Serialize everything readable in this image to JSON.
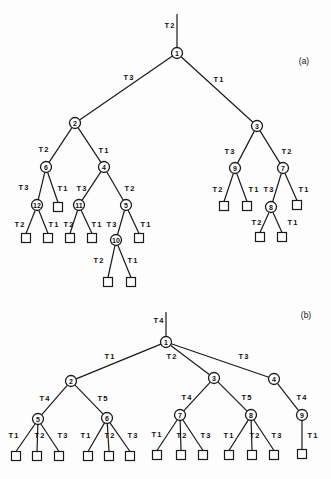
{
  "diagrams": [
    {
      "id": "a",
      "panel_label": "(a)",
      "panel_label_pos": [
        304,
        61
      ],
      "root_line": {
        "from": [
          177,
          14
        ],
        "to": [
          177,
          48
        ],
        "label": "T2",
        "label_pos": [
          170,
          25
        ]
      },
      "nodes": [
        {
          "id": "1",
          "x": 177,
          "y": 53
        },
        {
          "id": "2",
          "x": 75,
          "y": 123
        },
        {
          "id": "3",
          "x": 257,
          "y": 126
        },
        {
          "id": "6",
          "x": 46,
          "y": 167
        },
        {
          "id": "4",
          "x": 104,
          "y": 167
        },
        {
          "id": "12",
          "x": 37,
          "y": 205
        },
        {
          "id": "11",
          "x": 79,
          "y": 205
        },
        {
          "id": "5",
          "x": 126,
          "y": 205
        },
        {
          "id": "10",
          "x": 116,
          "y": 240
        },
        {
          "id": "9",
          "x": 235,
          "y": 168
        },
        {
          "id": "7",
          "x": 283,
          "y": 168
        },
        {
          "id": "8",
          "x": 271,
          "y": 207
        }
      ],
      "leaves": [
        {
          "id": "a-l1",
          "x": 58,
          "y": 207
        },
        {
          "id": "a-l2",
          "x": 26,
          "y": 238
        },
        {
          "id": "a-l3",
          "x": 48,
          "y": 238
        },
        {
          "id": "a-l4",
          "x": 70,
          "y": 238
        },
        {
          "id": "a-l5",
          "x": 92,
          "y": 238
        },
        {
          "id": "a-l6",
          "x": 139,
          "y": 238
        },
        {
          "id": "a-l7",
          "x": 108,
          "y": 282
        },
        {
          "id": "a-l8",
          "x": 131,
          "y": 282
        },
        {
          "id": "a-l9",
          "x": 224,
          "y": 206
        },
        {
          "id": "a-l10",
          "x": 247,
          "y": 206
        },
        {
          "id": "a-l11",
          "x": 297,
          "y": 205
        },
        {
          "id": "a-l12",
          "x": 260,
          "y": 237
        },
        {
          "id": "a-l13",
          "x": 282,
          "y": 237
        }
      ],
      "edges": [
        {
          "from": "1",
          "to": "2",
          "label": "T3",
          "label_pos": [
            129,
            77
          ]
        },
        {
          "from": "1",
          "to": "3",
          "label": "T1",
          "label_pos": [
            219,
            79
          ]
        },
        {
          "from": "2",
          "to": "6",
          "label": "T2",
          "label_pos": [
            44,
            149
          ]
        },
        {
          "from": "2",
          "to": "4",
          "label": "T1",
          "label_pos": [
            104,
            150
          ]
        },
        {
          "from": "6",
          "to": "12",
          "label": "T3",
          "label_pos": [
            24,
            187
          ]
        },
        {
          "from": "6",
          "to": "a-l1",
          "label": "T1",
          "label_pos": [
            63,
            188
          ]
        },
        {
          "from": "4",
          "to": "11",
          "label": "T3",
          "label_pos": [
            82,
            188
          ]
        },
        {
          "from": "4",
          "to": "5",
          "label": "T2",
          "label_pos": [
            130,
            188
          ]
        },
        {
          "from": "12",
          "to": "a-l2",
          "label": "T2",
          "label_pos": [
            20,
            224
          ]
        },
        {
          "from": "12",
          "to": "a-l3",
          "label": "T1",
          "label_pos": [
            54,
            224
          ]
        },
        {
          "from": "11",
          "to": "a-l4",
          "label": "T2",
          "label_pos": [
            69,
            224
          ]
        },
        {
          "from": "11",
          "to": "a-l5",
          "label": "T1",
          "label_pos": [
            97,
            224
          ]
        },
        {
          "from": "5",
          "to": "10",
          "label": "T3",
          "label_pos": [
            112,
            224
          ]
        },
        {
          "from": "5",
          "to": "a-l6",
          "label": "T1",
          "label_pos": [
            146,
            224
          ]
        },
        {
          "from": "10",
          "to": "a-l7",
          "label": "T2",
          "label_pos": [
            99,
            260
          ]
        },
        {
          "from": "10",
          "to": "a-l8",
          "label": "T1",
          "label_pos": [
            133,
            260
          ]
        },
        {
          "from": "3",
          "to": "9",
          "label": "T3",
          "label_pos": [
            230,
            151
          ]
        },
        {
          "from": "3",
          "to": "7",
          "label": "T2",
          "label_pos": [
            287,
            151
          ]
        },
        {
          "from": "9",
          "to": "a-l9",
          "label": "T2",
          "label_pos": [
            218,
            189
          ]
        },
        {
          "from": "9",
          "to": "a-l10",
          "label": "T1",
          "label_pos": [
            254,
            189
          ]
        },
        {
          "from": "7",
          "to": "8",
          "label": "T3",
          "label_pos": [
            269,
            189
          ]
        },
        {
          "from": "7",
          "to": "a-l11",
          "label": "T1",
          "label_pos": [
            304,
            189
          ]
        },
        {
          "from": "8",
          "to": "a-l12",
          "label": "T2",
          "label_pos": [
            257,
            222
          ]
        },
        {
          "from": "8",
          "to": "a-l13",
          "label": "T1",
          "label_pos": [
            293,
            222
          ]
        }
      ]
    },
    {
      "id": "b",
      "panel_label": "(b)",
      "panel_label_pos": [
        306,
        315
      ],
      "root_line": {
        "from": [
          166,
          312
        ],
        "to": [
          166,
          337
        ],
        "label": "T4",
        "label_pos": [
          159,
          320
        ]
      },
      "nodes": [
        {
          "id": "1",
          "x": 166,
          "y": 342
        },
        {
          "id": "2",
          "x": 71,
          "y": 381
        },
        {
          "id": "3",
          "x": 214,
          "y": 378
        },
        {
          "id": "4",
          "x": 274,
          "y": 379
        },
        {
          "id": "5",
          "x": 38,
          "y": 419
        },
        {
          "id": "6",
          "x": 107,
          "y": 418
        },
        {
          "id": "7",
          "x": 180,
          "y": 415
        },
        {
          "id": "8",
          "x": 251,
          "y": 415
        },
        {
          "id": "9",
          "x": 302,
          "y": 415
        }
      ],
      "leaves": [
        {
          "id": "b-l1",
          "x": 16,
          "y": 456
        },
        {
          "id": "b-l2",
          "x": 37,
          "y": 456
        },
        {
          "id": "b-l3",
          "x": 59,
          "y": 456
        },
        {
          "id": "b-l4",
          "x": 88,
          "y": 456
        },
        {
          "id": "b-l5",
          "x": 109,
          "y": 456
        },
        {
          "id": "b-l6",
          "x": 130,
          "y": 456
        },
        {
          "id": "b-l7",
          "x": 157,
          "y": 455
        },
        {
          "id": "b-l8",
          "x": 181,
          "y": 455
        },
        {
          "id": "b-l9",
          "x": 203,
          "y": 455
        },
        {
          "id": "b-l10",
          "x": 229,
          "y": 455
        },
        {
          "id": "b-l11",
          "x": 252,
          "y": 455
        },
        {
          "id": "b-l12",
          "x": 274,
          "y": 455
        },
        {
          "id": "b-l13",
          "x": 302,
          "y": 454
        }
      ],
      "edges": [
        {
          "from": "1",
          "to": "2",
          "label": "T1",
          "label_pos": [
            110,
            356
          ]
        },
        {
          "from": "1",
          "to": "3",
          "label": "T2",
          "label_pos": [
            172,
            356
          ]
        },
        {
          "from": "1",
          "to": "4",
          "label": "T3",
          "label_pos": [
            244,
            356
          ]
        },
        {
          "from": "2",
          "to": "5",
          "label": "T4",
          "label_pos": [
            45,
            398
          ]
        },
        {
          "from": "2",
          "to": "6",
          "label": "T5",
          "label_pos": [
            103,
            398
          ]
        },
        {
          "from": "3",
          "to": "7",
          "label": "T4",
          "label_pos": [
            187,
            397
          ]
        },
        {
          "from": "3",
          "to": "8",
          "label": "T5",
          "label_pos": [
            247,
            397
          ]
        },
        {
          "from": "4",
          "to": "9",
          "label": "T4",
          "label_pos": [
            302,
            397
          ]
        },
        {
          "from": "5",
          "to": "b-l1",
          "label": "T1",
          "label_pos": [
            14,
            435
          ]
        },
        {
          "from": "5",
          "to": "b-l2",
          "label": "T2",
          "label_pos": [
            40,
            435
          ]
        },
        {
          "from": "5",
          "to": "b-l3",
          "label": "T3",
          "label_pos": [
            63,
            435
          ]
        },
        {
          "from": "6",
          "to": "b-l4",
          "label": "T1",
          "label_pos": [
            86,
            435
          ]
        },
        {
          "from": "6",
          "to": "b-l5",
          "label": "T2",
          "label_pos": [
            110,
            435
          ]
        },
        {
          "from": "6",
          "to": "b-l6",
          "label": "T3",
          "label_pos": [
            133,
            435
          ]
        },
        {
          "from": "7",
          "to": "b-l7",
          "label": "T1",
          "label_pos": [
            157,
            434
          ]
        },
        {
          "from": "7",
          "to": "b-l8",
          "label": "T2",
          "label_pos": [
            182,
            435
          ]
        },
        {
          "from": "7",
          "to": "b-l9",
          "label": "T3",
          "label_pos": [
            206,
            435
          ]
        },
        {
          "from": "8",
          "to": "b-l10",
          "label": "T1",
          "label_pos": [
            229,
            435
          ]
        },
        {
          "from": "8",
          "to": "b-l11",
          "label": "T2",
          "label_pos": [
            255,
            435
          ]
        },
        {
          "from": "8",
          "to": "b-l12",
          "label": "T3",
          "label_pos": [
            277,
            435
          ]
        },
        {
          "from": "9",
          "to": "b-l13",
          "label": "T1",
          "label_pos": [
            313,
            435
          ]
        }
      ]
    }
  ],
  "style": {
    "line_color": "#1a1a1a",
    "background": "#fdfdfd",
    "node_radius": 5.5,
    "leaf_size": 9
  }
}
